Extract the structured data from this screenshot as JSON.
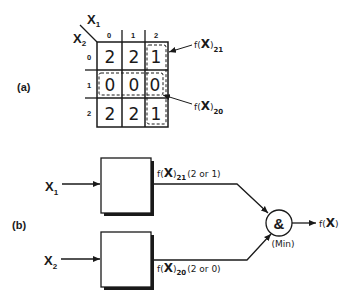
{
  "part_a": {
    "label": "(a)",
    "axis_x1": "X",
    "axis_x1_sub": "1",
    "axis_x2": "X",
    "axis_x2_sub": "2",
    "col_headers": [
      "0",
      "1",
      "2"
    ],
    "row_headers": [
      "0",
      "1",
      "2"
    ],
    "cells": [
      [
        "2",
        "2",
        "1"
      ],
      [
        "0",
        "0",
        "0"
      ],
      [
        "2",
        "2",
        "1"
      ]
    ],
    "callout_21": {
      "prefix": "f(",
      "var": "X",
      "suffix": ")",
      "sub": "21"
    },
    "callout_20": {
      "prefix": "f(",
      "var": "X",
      "suffix": ")",
      "sub": "20"
    }
  },
  "part_b": {
    "label": "(b)",
    "input_1": {
      "var": "X",
      "sub": "1"
    },
    "input_2": {
      "var": "X",
      "sub": "2"
    },
    "signal_1": {
      "prefix": "f(",
      "var": "X",
      "suffix": ")",
      "sub": "21",
      "note": "(2 or 1)"
    },
    "signal_2": {
      "prefix": "f(",
      "var": "X",
      "suffix": ")",
      "sub": "20",
      "note": "(2 or 0)"
    },
    "gate_symbol": "&",
    "gate_caption": "(Min)",
    "output": {
      "prefix": "f(",
      "var": "X",
      "suffix": ")"
    }
  }
}
